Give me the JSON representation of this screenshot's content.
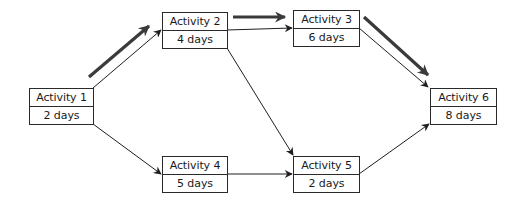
{
  "diagram": {
    "type": "activity-on-node network (critical path)",
    "nodes": [
      {
        "id": "a1",
        "name": "Activity 1",
        "duration": "2 days",
        "x": 29,
        "y": 88,
        "w": 65,
        "h": 37
      },
      {
        "id": "a2",
        "name": "Activity 2",
        "duration": "4 days",
        "x": 162,
        "y": 12,
        "w": 66,
        "h": 37
      },
      {
        "id": "a3",
        "name": "Activity 3",
        "duration": "6 days",
        "x": 293,
        "y": 10,
        "w": 67,
        "h": 37
      },
      {
        "id": "a4",
        "name": "Activity 4",
        "duration": "5 days",
        "x": 162,
        "y": 156,
        "w": 66,
        "h": 37
      },
      {
        "id": "a5",
        "name": "Activity 5",
        "duration": "2 days",
        "x": 293,
        "y": 156,
        "w": 67,
        "h": 37
      },
      {
        "id": "a6",
        "name": "Activity 6",
        "duration": "8 days",
        "x": 430,
        "y": 88,
        "w": 67,
        "h": 37
      }
    ],
    "edges": [
      {
        "from": "a1",
        "to": "a2",
        "x1": 93,
        "y1": 88,
        "x2": 161,
        "y2": 30
      },
      {
        "from": "a1",
        "to": "a4",
        "x1": 93,
        "y1": 124,
        "x2": 161,
        "y2": 174
      },
      {
        "from": "a2",
        "to": "a3",
        "x1": 227,
        "y1": 30,
        "x2": 292,
        "y2": 28
      },
      {
        "from": "a2",
        "to": "a5",
        "x1": 227,
        "y1": 48,
        "x2": 293,
        "y2": 155
      },
      {
        "from": "a3",
        "to": "a6",
        "x1": 359,
        "y1": 28,
        "x2": 428,
        "y2": 87
      },
      {
        "from": "a4",
        "to": "a5",
        "x1": 227,
        "y1": 174,
        "x2": 292,
        "y2": 174
      },
      {
        "from": "a5",
        "to": "a6",
        "x1": 359,
        "y1": 174,
        "x2": 429,
        "y2": 124
      }
    ],
    "critical_path": {
      "sequence": [
        "a1",
        "a2",
        "a3",
        "a6"
      ],
      "arrows": [
        {
          "from": "a1",
          "to": "a2",
          "x1": 89,
          "y1": 77,
          "x2": 149,
          "y2": 26
        },
        {
          "from": "a2",
          "to": "a3",
          "x1": 233,
          "y1": 17,
          "x2": 285,
          "y2": 17
        },
        {
          "from": "a3",
          "to": "a6",
          "x1": 364,
          "y1": 17,
          "x2": 428,
          "y2": 75
        }
      ]
    },
    "colors": {
      "line": "#1e1e1e",
      "critical": "#3a3a3a",
      "box_border": "#2a2a2a",
      "background": "#ffffff"
    }
  }
}
